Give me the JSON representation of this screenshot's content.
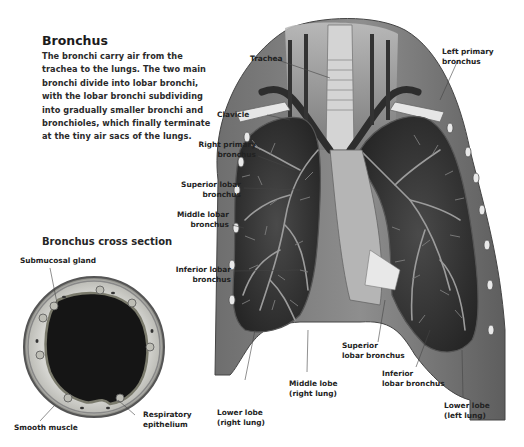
{
  "heading": "Bronchus",
  "description": "The bronchi carry air from the trachea to the lungs. The two main bronchi divide into lobar bronchi, with the lobar bronchi subdividing into gradually smaller bronchi and bronchioles, which finally terminate at the tiny air sacs of the lungs.",
  "cross_section": {
    "title": "Bronchus cross section",
    "labels": {
      "submucosal_gland": "Submucosal gland",
      "smooth_muscle": "Smooth muscle",
      "respiratory_epithelium_1": "Respiratory",
      "respiratory_epithelium_2": "epithelium"
    }
  },
  "lung_labels": {
    "trachea": "Trachea",
    "left_primary_1": "Left primary",
    "left_primary_2": "bronchus",
    "clavicle": "Clavicle",
    "right_primary_1": "Right primary",
    "right_primary_2": "bronchus",
    "superior_lobar_1": "Superior lobar",
    "superior_lobar_2": "bronchus",
    "middle_lobar_1": "Middle lobar",
    "middle_lobar_2": "bronchus",
    "inferior_lobar_1": "Inferior lobar",
    "inferior_lobar_2": "bronchus",
    "superior_lobar_left_1": "Superior",
    "superior_lobar_left_2": "lobar bronchus",
    "inferior_lobar_left_1": "Inferior",
    "inferior_lobar_left_2": "lobar bronchus",
    "middle_lobe_1": "Middle lobe",
    "middle_lobe_2": "(right lung)",
    "lower_lobe_right_1": "Lower lobe",
    "lower_lobe_right_2": "(right lung)",
    "lower_lobe_left_1": "Lower lobe",
    "lower_lobe_left_2": "(left lung)"
  },
  "colors": {
    "background": "#ffffff",
    "text": "#222222",
    "lung_tissue": "#3a3a3a",
    "bronchi": "#b8b8b8",
    "lumen": "#141414"
  }
}
